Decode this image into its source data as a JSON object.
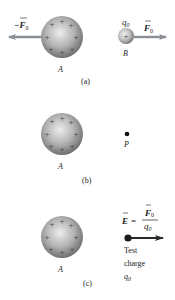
{
  "panels": [
    {
      "id": "a",
      "caption": "(a)",
      "sphere_label": "A",
      "test_charge_label": "B",
      "charge_symbol": "q",
      "charge_subscript": "0",
      "force_left_label": "−F",
      "force_left_sub": "0",
      "force_right_label": "F",
      "force_right_sub": "0"
    },
    {
      "id": "b",
      "caption": "(b)",
      "sphere_label": "A",
      "point_label": "P"
    },
    {
      "id": "c",
      "caption": "(c)",
      "sphere_label": "A",
      "field_eq_lhs": "E",
      "field_eq_equals": "=",
      "field_eq_num": "F",
      "field_eq_num_sub": "0",
      "field_eq_den": "q",
      "field_eq_den_sub": "0",
      "test_label_line1": "Test",
      "test_label_line2": "charge",
      "test_label_line3_sym": "q",
      "test_label_line3_sub": "0"
    }
  ],
  "colors": {
    "sphere_light": "#e6e6e6",
    "sphere_dark": "#7a7a7a",
    "arrow_gray": "#8a8f94",
    "arrow_dark": "#2a2a2a",
    "plus": "#444444"
  }
}
